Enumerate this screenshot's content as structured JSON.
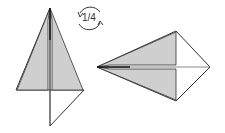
{
  "diagram": {
    "title": "",
    "rotation_label": "1/4",
    "colors": {
      "flap_fill": "#cfcfcf",
      "paper": "#ffffff",
      "stroke": "#333333"
    },
    "steps": [
      {
        "name": "kite-vertical",
        "description": "Kite shape with gray folded flaps meeting at center"
      },
      {
        "name": "kite-rotated",
        "description": "Same model rotated a quarter turn, point facing left"
      }
    ]
  }
}
